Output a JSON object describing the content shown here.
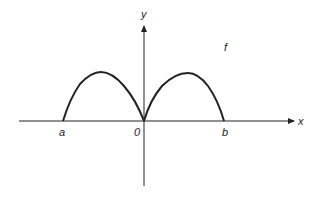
{
  "diagram": {
    "function_label": "f",
    "axes": {
      "x_label": "x",
      "y_label": "y"
    },
    "ticks": {
      "a": "a",
      "origin": "0",
      "b": "b"
    },
    "colors": {
      "stroke": "#222222",
      "background": "#ffffff"
    }
  }
}
